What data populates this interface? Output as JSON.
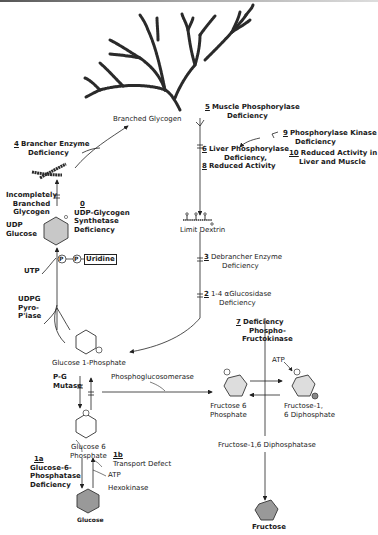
{
  "diagram": {
    "nodes": {
      "branched_glycogen": "Branched Glycogen",
      "incompletely_branched": [
        "Incompletely",
        "Branched",
        "Glycogen"
      ],
      "limit_dextrin": "Limit Dextrin",
      "udp_glucose": [
        "UDP",
        "Glucose"
      ],
      "utp": "UTP",
      "uridine": "Uridine",
      "p_label": "P",
      "udpg_pyro": [
        "UDPG",
        "Pyro-",
        "P'iase"
      ],
      "glucose_1_phosphate": "Glucose 1-Phosphate",
      "pg_mutase": [
        "P-G",
        "Mutase"
      ],
      "glucose_6_phosphate": [
        "Glucose 6",
        "Phosphate"
      ],
      "phosphoglucosomerase": "Phosphoglucosomerase",
      "fructose_6_phosphate": [
        "Fructose 6",
        "Phosphate"
      ],
      "fructose_16_diphosphate": [
        "Fructose-1,",
        "6 Diphosphate"
      ],
      "fructose_16_diphosphatase": "Fructose-1,6 Diphosphatase",
      "fructose": "Fructose",
      "glucose": "Glucose",
      "atp_pfk": "ATP",
      "atp_hex": "ATP",
      "hexokinase": "Hexokinase"
    },
    "deficiencies": [
      {
        "num": "1a",
        "lines": [
          "Glucose-6-",
          "Phosphatase",
          "Deficiency"
        ]
      },
      {
        "num": "1b",
        "lines": [
          "Transport Defect"
        ]
      },
      {
        "num": "2",
        "lines": [
          "1-4 αGlucosidase",
          "Deficiency"
        ]
      },
      {
        "num": "3",
        "lines": [
          "Debrancher Enzyme",
          "Deficiency"
        ]
      },
      {
        "num": "4",
        "lines": [
          "Brancher Enzyme",
          "Deficiency"
        ]
      },
      {
        "num": "5",
        "lines": [
          "Muscle Phosphorylase",
          "Deficiency"
        ]
      },
      {
        "num": "6",
        "lines": [
          "Liver Phosphorylase",
          "Deficiency,"
        ]
      },
      {
        "num": "7",
        "lines": [
          "Deficiency",
          "Phospho-",
          "Fructokinase"
        ]
      },
      {
        "num": "8",
        "lines": [
          "Reduced Activity"
        ]
      },
      {
        "num": "9",
        "lines": [
          "Phosphorylase Kinase",
          "Deficiency"
        ]
      },
      {
        "num": "10",
        "lines": [
          "Reduced Activity in",
          "Liver and Muscle"
        ]
      },
      {
        "num": "0",
        "lines": [
          "UDP-Glycogen",
          "Synthetase",
          "Deficiency"
        ]
      }
    ]
  }
}
